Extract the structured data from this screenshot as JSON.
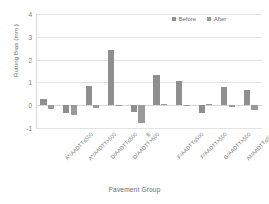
{
  "chart_data": {
    "type": "bar",
    "title": "",
    "xlabel": "Pavement Group",
    "ylabel": "Rutting Bias (mm )",
    "ylim": [
      -1,
      4
    ],
    "yticks": [
      4,
      3,
      2,
      1,
      0,
      -1
    ],
    "grid": true,
    "legend_position": "top-right",
    "categories": [
      "A*/AADTT≤500",
      "A*/AADTT>500",
      "D/AADTT≤500",
      "D/AADTT>500",
      "E",
      "F/AADTT≤500",
      "F/AADTT>500",
      "G/AADTT>500",
      "All/AADTT≤500",
      "All/AADTT>500"
    ],
    "series": [
      {
        "name": "Before",
        "color": "#8f8f8f",
        "values": [
          0.28,
          -0.36,
          0.83,
          2.4,
          -0.3,
          1.32,
          1.08,
          -0.35,
          0.78,
          0.66
        ]
      },
      {
        "name": "After",
        "color": "#9a9a9a",
        "values": [
          -0.17,
          -0.43,
          -0.14,
          0.03,
          -0.8,
          0.04,
          0.0,
          0.05,
          -0.1,
          -0.19
        ]
      }
    ]
  },
  "legend": {
    "items": [
      {
        "label": "Before"
      },
      {
        "label": "After"
      }
    ]
  },
  "colors": {
    "before": "#8f8f8f",
    "after": "#9a9a9a",
    "grid": "#e3e3e3",
    "text": "#6f6f6f"
  }
}
